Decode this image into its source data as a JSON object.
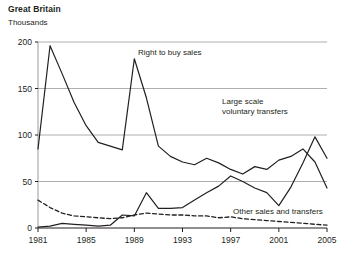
{
  "chart_data": {
    "type": "line",
    "title": "Great Britain",
    "subtitle": "Thousands",
    "xlabel": "",
    "ylabel": "Thousands",
    "ylim": [
      0,
      200
    ],
    "xlim": [
      1981,
      2005
    ],
    "yticks": [
      "0",
      "50",
      "100",
      "150",
      "200"
    ],
    "ytick_values": [
      0,
      50,
      100,
      150,
      200
    ],
    "xticks": [
      "1981",
      "1985",
      "1989",
      "1993",
      "1997",
      "2001",
      "2005"
    ],
    "xtick_values": [
      1981,
      1985,
      1989,
      1993,
      1997,
      2001,
      2005
    ],
    "grid": "horizontal",
    "legend": "inline-annotations",
    "x": [
      1981,
      1982,
      1983,
      1984,
      1985,
      1986,
      1987,
      1988,
      1989,
      1990,
      1991,
      1992,
      1993,
      1994,
      1995,
      1996,
      1997,
      1998,
      1999,
      2000,
      2001,
      2002,
      2003,
      2004,
      2005
    ],
    "series": [
      {
        "name": "Right to buy sales",
        "style": "solid",
        "color": "#231f20",
        "values": [
          85,
          196,
          166,
          135,
          110,
          92,
          88,
          84,
          182,
          140,
          88,
          77,
          71,
          68,
          75,
          70,
          63,
          58,
          66,
          63,
          73,
          77,
          85,
          71,
          43
        ]
      },
      {
        "name": "Large scale voluntary transfers",
        "style": "solid",
        "color": "#231f20",
        "values": [
          1,
          2,
          5,
          4,
          3,
          2,
          3,
          14,
          13,
          38,
          21,
          21,
          22,
          30,
          38,
          45,
          56,
          50,
          43,
          38,
          24,
          44,
          70,
          98,
          75
        ]
      },
      {
        "name": "Other sales and transfers",
        "style": "dashed",
        "color": "#231f20",
        "values": [
          30,
          22,
          16,
          13,
          12,
          11,
          10,
          11,
          14,
          16,
          15,
          14,
          14,
          13,
          13,
          11,
          12,
          10,
          9,
          8,
          7,
          6,
          5,
          4,
          3
        ]
      }
    ],
    "annotations": [
      {
        "name": "right-to-buy-sales-label",
        "text": "Right to buy sales",
        "x_px": 138,
        "y_px": 52
      },
      {
        "name": "large-scale-voluntary-transfers-label",
        "text_line1": "Large scale",
        "text_line2": "voluntary transfers",
        "x_px": 222,
        "y_px": 101
      },
      {
        "name": "other-sales-and-transfers-label",
        "text": "Other sales and transfers",
        "x_px": 233,
        "y_px": 211
      }
    ]
  }
}
